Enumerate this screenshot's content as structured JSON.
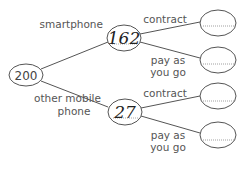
{
  "tree": {
    "root": {
      "value": "200"
    },
    "branches": [
      {
        "label": "smartphone",
        "value": "162",
        "children": [
          {
            "label_lines": [
              "contract"
            ],
            "value": ""
          },
          {
            "label_lines": [
              "pay as",
              "you go"
            ],
            "value": ""
          }
        ]
      },
      {
        "label_lines": [
          "other mobile",
          "phone"
        ],
        "value": "27",
        "children": [
          {
            "label_lines": [
              "contract"
            ],
            "value": ""
          },
          {
            "label_lines": [
              "pay as",
              "you go"
            ],
            "value": ""
          }
        ]
      }
    ]
  },
  "colors": {
    "line": "#555555",
    "text": "#555555",
    "handwriting": "#222222"
  }
}
